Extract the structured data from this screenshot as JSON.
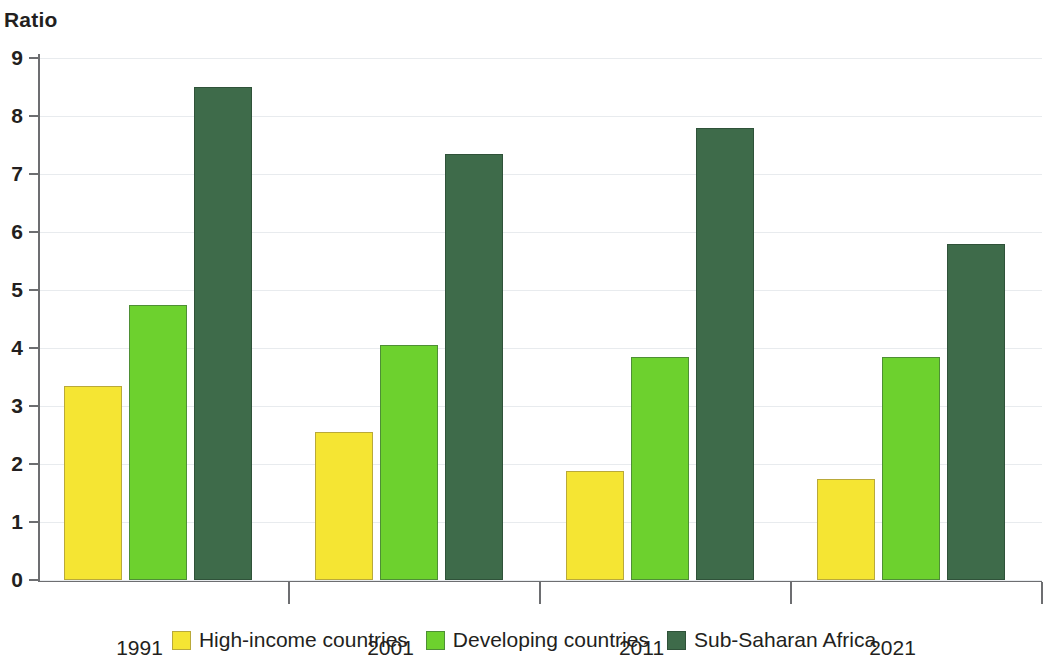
{
  "chart_data": {
    "type": "bar",
    "title": "",
    "subtitle": "",
    "ylabel": "Ratio",
    "xlabel": "",
    "ylim": [
      0,
      9
    ],
    "yticks": [
      0,
      1,
      2,
      3,
      4,
      5,
      6,
      7,
      8,
      9
    ],
    "ytick_labels": [
      "0",
      "1",
      "2",
      "3",
      "4",
      "5",
      "6",
      "7",
      "8",
      "9"
    ],
    "grid": true,
    "legend_position": "bottom",
    "categories": [
      "1991",
      "2001",
      "2011",
      "2021"
    ],
    "series": [
      {
        "name": "High-income countries",
        "color": "#F5E533",
        "border": "#B9A93A",
        "values": [
          3.35,
          2.55,
          1.88,
          1.75
        ]
      },
      {
        "name": "Developing countries",
        "color": "#6DD12E",
        "border": "#4E8F35",
        "values": [
          4.75,
          4.05,
          3.85,
          3.85
        ]
      },
      {
        "name": "Sub-Saharan Africa",
        "color": "#3E6B4A",
        "border": "#2F5239",
        "values": [
          8.5,
          7.35,
          7.8,
          5.8
        ]
      }
    ]
  },
  "axis": {
    "y_title": "Ratio"
  },
  "legend": {
    "items": [
      {
        "label": "High-income countries"
      },
      {
        "label": "Developing countries"
      },
      {
        "label": "Sub-Saharan Africa"
      }
    ]
  }
}
